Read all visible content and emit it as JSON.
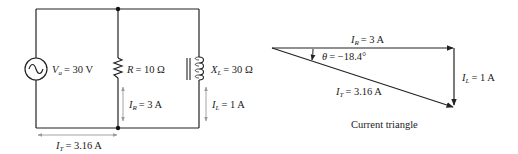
{
  "circuit": {
    "source": {
      "symbol": "V",
      "subscript": "a",
      "value": "= 30 V"
    },
    "resistor": {
      "symbol": "R",
      "value": "= 10 Ω"
    },
    "inductor": {
      "symbol": "X",
      "subscript": "L",
      "value": "= 30 Ω"
    },
    "branch_currents": {
      "resistor": {
        "symbol": "I",
        "subscript": "R",
        "value": "= 3 A"
      },
      "inductor": {
        "symbol": "I",
        "subscript": "L",
        "value": "= 1 A"
      }
    },
    "total_current": {
      "symbol": "I",
      "subscript": "T",
      "value": "= 3.16 A"
    }
  },
  "triangle": {
    "ir_label": {
      "symbol": "I",
      "subscript": "R",
      "value": "= 3 A"
    },
    "il_label": {
      "symbol": "I",
      "subscript": "L",
      "value": "= 1 A"
    },
    "it_label": {
      "symbol": "I",
      "subscript": "T",
      "value": "= 3.16 A"
    },
    "angle_label": {
      "symbol": "θ",
      "value": "= −18.4°"
    },
    "caption": "Current triangle"
  },
  "colors": {
    "wire": "#222222",
    "annotation_arrow": "#9a9a9a",
    "text": "#222222"
  }
}
